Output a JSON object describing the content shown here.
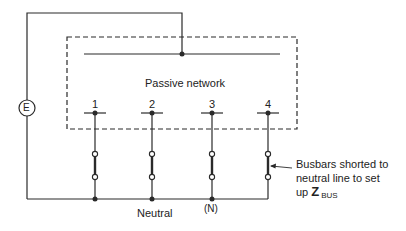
{
  "diagram": {
    "type": "circuit-schematic",
    "source_label": "E",
    "network_label": "Passive network",
    "busbars": [
      {
        "label": "1",
        "x": 95
      },
      {
        "label": "2",
        "x": 152
      },
      {
        "label": "3",
        "x": 212
      },
      {
        "label": "4",
        "x": 268
      }
    ],
    "neutral_label": "Neutral",
    "neutral_node_label": "(N)",
    "annotation": {
      "line1": "Busbars shorted to",
      "line2": "neutral line to set",
      "line3_prefix": "up ",
      "symbol": "Z",
      "subscript": "BUS"
    },
    "colors": {
      "stroke": "#2a2a2a",
      "background": "#ffffff"
    }
  }
}
